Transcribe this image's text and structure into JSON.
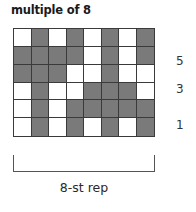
{
  "title": "multiple of 8",
  "chart": {
    "columns": 8,
    "rows": 6,
    "colors": {
      "filled": "#7a7a7a",
      "empty": "#ffffff",
      "gridline": "#3a3a3a"
    },
    "cells_top_to_bottom": [
      [
        0,
        1,
        0,
        1,
        0,
        1,
        0,
        1
      ],
      [
        1,
        1,
        1,
        1,
        0,
        1,
        0,
        1
      ],
      [
        1,
        1,
        1,
        0,
        0,
        1,
        0,
        0
      ],
      [
        0,
        1,
        0,
        0,
        1,
        1,
        1,
        0
      ],
      [
        0,
        1,
        0,
        1,
        1,
        1,
        1,
        1
      ],
      [
        0,
        1,
        0,
        1,
        0,
        1,
        0,
        1
      ]
    ]
  },
  "row_labels": [
    {
      "label": "5",
      "row_from_bottom": 5
    },
    {
      "label": "3",
      "row_from_bottom": 3
    },
    {
      "label": "1",
      "row_from_bottom": 1
    }
  ],
  "repeat_label": "8-st rep"
}
